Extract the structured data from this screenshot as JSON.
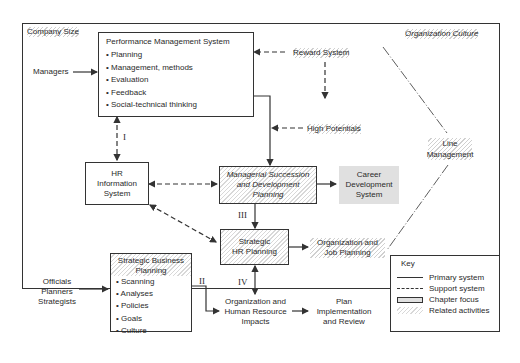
{
  "frame": {
    "top_left_label": "Company Size",
    "top_right_label": "Organization Culture"
  },
  "pms": {
    "title": "Performance Management System",
    "items": [
      "Planning",
      "Management, methods",
      "Evaluation",
      "Feedback",
      "Social-technical thinking"
    ]
  },
  "inputs": {
    "managers": "Managers",
    "reward_system": "Reward System",
    "high_potentials": "High Potentials",
    "officials": [
      "Officials",
      "Planners",
      "Strategists"
    ],
    "line_management": [
      "Line",
      "Management"
    ]
  },
  "hris": {
    "lines": [
      "HR",
      "Information",
      "System"
    ]
  },
  "msdp": {
    "lines": [
      "Managerial Succession",
      "and Development",
      "Planning"
    ]
  },
  "cds": {
    "lines": [
      "Career",
      "Development",
      "System"
    ]
  },
  "shrp": {
    "lines": [
      "Strategic",
      "HR Planning"
    ]
  },
  "ojp": {
    "lines": [
      "Organization and",
      "Job Planning"
    ]
  },
  "sbp": {
    "title_lines": [
      "Strategic Business",
      "Planning"
    ],
    "items": [
      "Scanning",
      "Analyses",
      "Policies",
      "Goals",
      "Culture"
    ]
  },
  "ohri": {
    "lines": [
      "Organization and",
      "Human Resource",
      "Impacts"
    ]
  },
  "pir": {
    "lines": [
      "Plan",
      "Implementation",
      "and Review"
    ]
  },
  "roman": {
    "i": "I",
    "ii": "II",
    "iii": "III",
    "iv": "IV"
  },
  "key": {
    "title": "Key",
    "items": [
      "Primary system",
      "Support system",
      "Chapter focus",
      "Related activities"
    ]
  },
  "colors": {
    "line": "#333333",
    "focus_fill": "#e0e0e0",
    "hatch": "#d8d8d8"
  }
}
